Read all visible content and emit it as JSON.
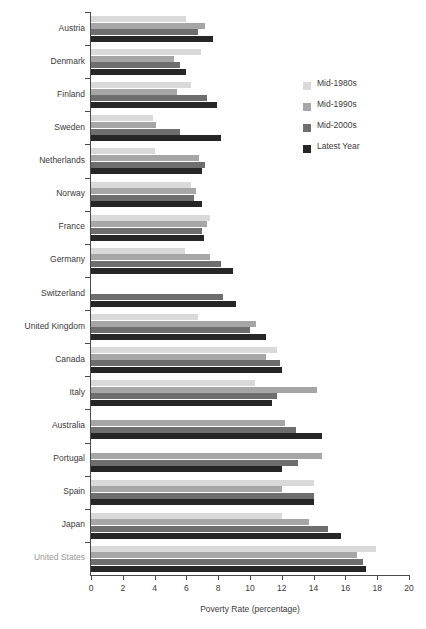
{
  "chart_data": {
    "type": "bar",
    "orientation": "horizontal",
    "title": "",
    "xlabel": "Poverty Rate (percentage)",
    "ylabel": "",
    "xlim": [
      0,
      20
    ],
    "xticks": [
      0,
      2,
      4,
      6,
      8,
      10,
      12,
      14,
      16,
      18,
      20
    ],
    "grid": false,
    "legend_position": "upper right",
    "categories": [
      "Austria",
      "Denmark",
      "Finland",
      "Sweden",
      "Netherlands",
      "Norway",
      "France",
      "Germany",
      "Switzerland",
      "United Kingdom",
      "Canada",
      "Italy",
      "Australia",
      "Portugal",
      "Spain",
      "Japan",
      "United States"
    ],
    "highlighted_category": "United States",
    "series": [
      {
        "name": "Mid-1980s",
        "color": "#d9d9d9",
        "values": [
          6.0,
          6.9,
          6.3,
          3.9,
          4.0,
          6.3,
          7.5,
          5.9,
          null,
          6.7,
          11.7,
          10.3,
          null,
          null,
          14.0,
          12.0,
          17.9
        ]
      },
      {
        "name": "Mid-1990s",
        "color": "#a6a6a6",
        "values": [
          7.2,
          5.2,
          5.4,
          4.1,
          6.8,
          6.6,
          7.3,
          7.5,
          null,
          10.4,
          11.0,
          14.2,
          12.2,
          14.5,
          12.0,
          13.7,
          16.7
        ]
      },
      {
        "name": "Mid-2000s",
        "color": "#6e6e6e",
        "values": [
          6.7,
          5.6,
          7.3,
          5.6,
          7.2,
          6.5,
          7.0,
          8.2,
          8.3,
          10.0,
          11.9,
          11.7,
          12.9,
          13.0,
          14.0,
          14.9,
          17.1
        ]
      },
      {
        "name": "Latest Year",
        "color": "#262626",
        "values": [
          7.7,
          6.0,
          7.9,
          8.2,
          7.0,
          7.0,
          7.1,
          8.9,
          9.1,
          11.0,
          12.0,
          11.4,
          14.5,
          12.0,
          14.0,
          15.7,
          17.3
        ]
      }
    ]
  }
}
